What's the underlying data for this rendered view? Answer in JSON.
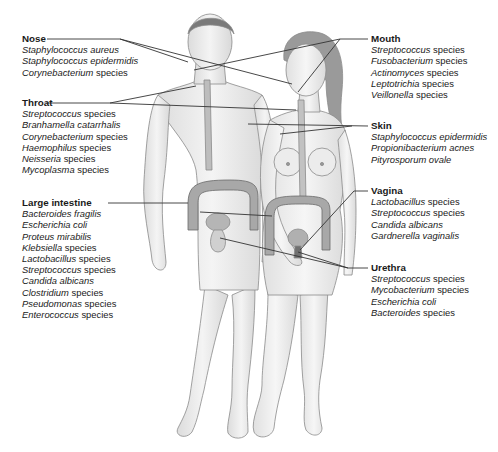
{
  "diagram": {
    "sites": {
      "nose": {
        "title": "Nose",
        "items": [
          {
            "italic": "Staphylococcus aureus",
            "plain": ""
          },
          {
            "italic": "Staphylococcus epidermidis",
            "plain": ""
          },
          {
            "italic": "Corynebacterium",
            "plain": " species"
          }
        ]
      },
      "throat": {
        "title": "Throat",
        "items": [
          {
            "italic": "Streptococcus",
            "plain": " species"
          },
          {
            "italic": "Branhamella catarrhalis",
            "plain": ""
          },
          {
            "italic": "Corynebacterium",
            "plain": " species"
          },
          {
            "italic": "Haemophilus",
            "plain": " species"
          },
          {
            "italic": "Neisseria",
            "plain": " species"
          },
          {
            "italic": "Mycoplasma",
            "plain": " species"
          }
        ]
      },
      "large_intestine": {
        "title": "Large intestine",
        "items": [
          {
            "italic": "Bacteroides fragilis",
            "plain": ""
          },
          {
            "italic": "Escherichia coli",
            "plain": ""
          },
          {
            "italic": "Proteus mirabilis",
            "plain": ""
          },
          {
            "italic": "Klebsiella",
            "plain": " species"
          },
          {
            "italic": "Lactobacillus",
            "plain": " species"
          },
          {
            "italic": "Streptococcus",
            "plain": " species"
          },
          {
            "italic": "Candida albicans",
            "plain": ""
          },
          {
            "italic": "Clostridium",
            "plain": " species"
          },
          {
            "italic": "Pseudomonas",
            "plain": " species"
          },
          {
            "italic": "Enterococcus",
            "plain": " species"
          }
        ]
      },
      "mouth": {
        "title": "Mouth",
        "items": [
          {
            "italic": "Streptococcus",
            "plain": " species"
          },
          {
            "italic": "Fusobacterium",
            "plain": " species"
          },
          {
            "italic": "Actinomyces",
            "plain": " species"
          },
          {
            "italic": "Leptotrichia",
            "plain": " species"
          },
          {
            "italic": "Veillonella",
            "plain": " species"
          }
        ]
      },
      "skin": {
        "title": "Skin",
        "items": [
          {
            "italic": "Staphylococcus epidermidis",
            "plain": ""
          },
          {
            "italic": "Propionibacterium acnes",
            "plain": ""
          },
          {
            "italic": "Pityrosporum ovale",
            "plain": ""
          }
        ]
      },
      "vagina": {
        "title": "Vagina",
        "items": [
          {
            "italic": "Lactobacillus",
            "plain": " species"
          },
          {
            "italic": "Streptococcus",
            "plain": " species"
          },
          {
            "italic": "Candida albicans",
            "plain": ""
          },
          {
            "italic": "Gardnerella vaginalis",
            "plain": ""
          }
        ]
      },
      "urethra": {
        "title": "Urethra",
        "items": [
          {
            "italic": "Streptococcus",
            "plain": " species"
          },
          {
            "italic": "Mycobacterium",
            "plain": " species"
          },
          {
            "italic": "Escherichia coli",
            "plain": ""
          },
          {
            "italic": "Bacteroides",
            "plain": " species"
          }
        ]
      }
    },
    "colors": {
      "skin_fill": "#ededed",
      "outline": "#8a8a8a",
      "leader_line": "#333333",
      "text": "#1a1a1a",
      "organ": "#a8a8a8"
    }
  }
}
